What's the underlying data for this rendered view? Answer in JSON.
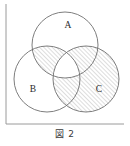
{
  "figure": {
    "caption": "図 2",
    "type": "venn-diagram-3-set",
    "frame": {
      "visible": true,
      "border_color": "#9a9a9a",
      "sides_drawn": [
        "left",
        "bottom"
      ],
      "left_x": 6,
      "bottom_y": 124,
      "right_x": 124,
      "top_y": 4
    },
    "style": {
      "circle_stroke": "#6f6f6f",
      "hatch_stroke": "#8d8d8d",
      "hatch_angle_deg": 45,
      "hatch_spacing_px": 3,
      "label_color": "#2b2b2b",
      "background": "#ffffff"
    },
    "circles": [
      {
        "id": "A",
        "label": "A",
        "cx": 65,
        "cy": 45,
        "r": 33,
        "label_x": 68,
        "label_y": 28
      },
      {
        "id": "B",
        "label": "B",
        "cx": 47,
        "cy": 79,
        "r": 33,
        "label_x": 33,
        "label_y": 92
      },
      {
        "id": "C",
        "label": "C",
        "cx": 86,
        "cy": 79,
        "r": 33,
        "label_x": 99,
        "label_y": 92
      }
    ],
    "regions": [
      {
        "id": "A-only",
        "name": "A only",
        "shaded": false
      },
      {
        "id": "B-only",
        "name": "B only",
        "shaded": false
      },
      {
        "id": "C-only",
        "name": "C only",
        "shaded": true
      },
      {
        "id": "AB",
        "name": "A intersect B not C",
        "shaded": true
      },
      {
        "id": "AC",
        "name": "A intersect C not B",
        "shaded": true
      },
      {
        "id": "BC",
        "name": "B intersect C not A",
        "shaded": true
      },
      {
        "id": "ABC",
        "name": "A intersect B intersect C",
        "shaded": false
      },
      {
        "id": "outside",
        "name": "outside all circles",
        "shaded": false
      }
    ]
  }
}
